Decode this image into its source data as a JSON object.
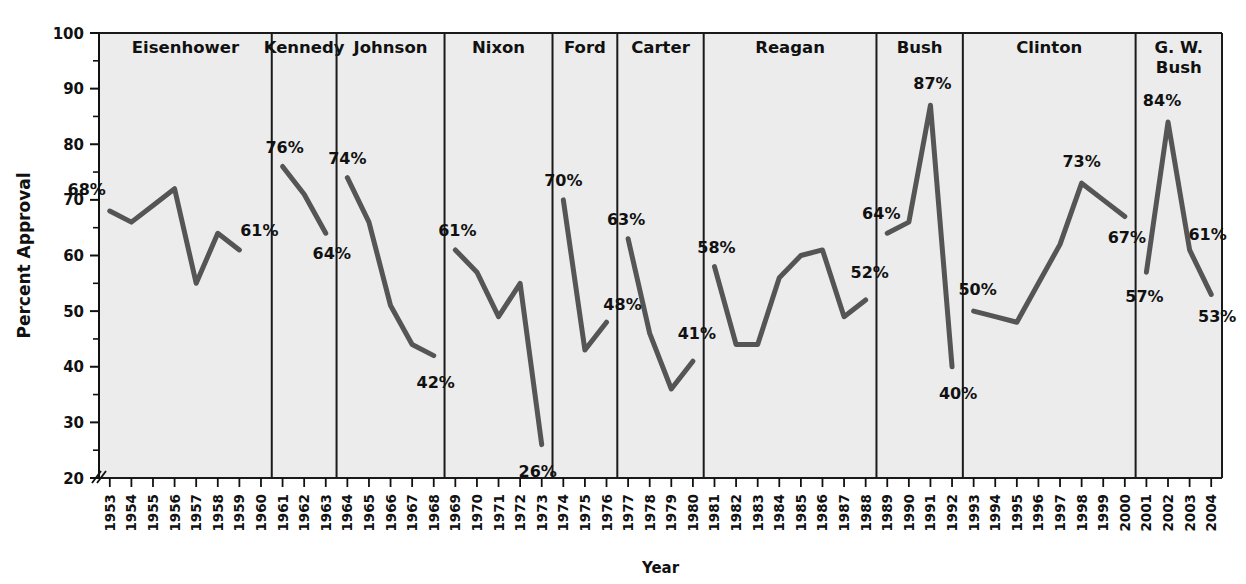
{
  "chart_data": {
    "type": "line",
    "title": "",
    "xlabel": "Year",
    "ylabel": "Percent Approval",
    "ylim": [
      20,
      100
    ],
    "y_ticks_major": [
      20,
      30,
      40,
      50,
      60,
      70,
      80,
      90,
      100
    ],
    "y_ticks_minor": [
      25,
      35,
      45,
      55,
      65,
      75,
      85,
      95
    ],
    "y_axis_break": true,
    "grid": false,
    "legend": "none",
    "line_color": "#555555",
    "panel_background": "#ececec",
    "panel_border_color": "#1a1a1a",
    "x": [
      1953,
      1954,
      1955,
      1956,
      1957,
      1958,
      1959,
      1960,
      1961,
      1962,
      1963,
      1964,
      1965,
      1966,
      1967,
      1968,
      1969,
      1970,
      1971,
      1972,
      1973,
      1974,
      1975,
      1976,
      1977,
      1978,
      1979,
      1980,
      1981,
      1982,
      1983,
      1984,
      1985,
      1986,
      1987,
      1988,
      1989,
      1990,
      1991,
      1992,
      1993,
      1994,
      1995,
      1996,
      1997,
      1998,
      1999,
      2000,
      2001,
      2002,
      2003,
      2004
    ],
    "panels": [
      {
        "name": "Eisenhower",
        "years": [
          1953,
          1954,
          1955,
          1956,
          1957,
          1958,
          1959,
          1960
        ],
        "values": [
          68,
          66,
          69,
          72,
          55,
          64,
          61,
          null
        ],
        "annotations": [
          {
            "label": "68%",
            "year": 1953,
            "value": 68
          },
          {
            "label": "61%",
            "year": 1959,
            "value": 61
          }
        ]
      },
      {
        "name": "Kennedy",
        "years": [
          1961,
          1962,
          1963
        ],
        "values": [
          76,
          71,
          64
        ],
        "annotations": [
          {
            "label": "76%",
            "year": 1961,
            "value": 76
          },
          {
            "label": "64%",
            "year": 1963,
            "value": 64
          }
        ]
      },
      {
        "name": "Johnson",
        "years": [
          1964,
          1965,
          1966,
          1967,
          1968
        ],
        "values": [
          74,
          66,
          51,
          44,
          42
        ],
        "annotations": [
          {
            "label": "74%",
            "year": 1964,
            "value": 74
          },
          {
            "label": "42%",
            "year": 1968,
            "value": 42
          }
        ]
      },
      {
        "name": "Nixon",
        "years": [
          1969,
          1970,
          1971,
          1972,
          1973
        ],
        "values": [
          61,
          57,
          49,
          55,
          26
        ],
        "annotations": [
          {
            "label": "61%",
            "year": 1969,
            "value": 61
          },
          {
            "label": "26%",
            "year": 1973,
            "value": 26
          }
        ]
      },
      {
        "name": "Ford",
        "years": [
          1974,
          1975,
          1976
        ],
        "values": [
          70,
          43,
          48
        ],
        "annotations": [
          {
            "label": "70%",
            "year": 1974,
            "value": 70
          },
          {
            "label": "48%",
            "year": 1976,
            "value": 48
          }
        ]
      },
      {
        "name": "Carter",
        "years": [
          1977,
          1978,
          1979,
          1980
        ],
        "values": [
          63,
          46,
          36,
          41
        ],
        "annotations": [
          {
            "label": "63%",
            "year": 1977,
            "value": 63
          },
          {
            "label": "41%",
            "year": 1980,
            "value": 41
          }
        ]
      },
      {
        "name": "Reagan",
        "years": [
          1981,
          1982,
          1983,
          1984,
          1985,
          1986,
          1987,
          1988
        ],
        "values": [
          58,
          44,
          44,
          56,
          60,
          61,
          49,
          52
        ],
        "annotations": [
          {
            "label": "58%",
            "year": 1981,
            "value": 58
          },
          {
            "label": "52%",
            "year": 1988,
            "value": 52
          }
        ]
      },
      {
        "name": "Bush",
        "years": [
          1989,
          1990,
          1991,
          1992
        ],
        "values": [
          64,
          66,
          87,
          40
        ],
        "annotations": [
          {
            "label": "64%",
            "year": 1989,
            "value": 64
          },
          {
            "label": "87%",
            "year": 1991,
            "value": 87
          },
          {
            "label": "40%",
            "year": 1992,
            "value": 40
          }
        ]
      },
      {
        "name": "Clinton",
        "years": [
          1993,
          1994,
          1995,
          1996,
          1997,
          1998,
          1999,
          2000
        ],
        "values": [
          50,
          49,
          48,
          55,
          62,
          73,
          70,
          67
        ],
        "annotations": [
          {
            "label": "50%",
            "year": 1993,
            "value": 50
          },
          {
            "label": "73%",
            "year": 1998,
            "value": 73
          },
          {
            "label": "67%",
            "year": 2000,
            "value": 67
          }
        ]
      },
      {
        "name": "G. W.\nBush",
        "name_lines": [
          "G. W.",
          "Bush"
        ],
        "years": [
          2001,
          2002,
          2003,
          2004
        ],
        "values": [
          57,
          84,
          61,
          53
        ],
        "annotations": [
          {
            "label": "57%",
            "year": 2001,
            "value": 57
          },
          {
            "label": "84%",
            "year": 2002,
            "value": 84
          },
          {
            "label": "61%",
            "year": 2003,
            "value": 61
          },
          {
            "label": "53%",
            "year": 2004,
            "value": 53
          }
        ]
      }
    ]
  },
  "axes": {
    "y_label": "Percent Approval",
    "x_label": "Year",
    "y_tick_labels": [
      "20",
      "30",
      "40",
      "50",
      "60",
      "70",
      "80",
      "90",
      "100"
    ],
    "x_tick_labels": [
      "1953",
      "1954",
      "1955",
      "1956",
      "1957",
      "1958",
      "1959",
      "1960",
      "1961",
      "1962",
      "1963",
      "1964",
      "1965",
      "1966",
      "1967",
      "1968",
      "1969",
      "1970",
      "1971",
      "1972",
      "1973",
      "1974",
      "1975",
      "1976",
      "1977",
      "1978",
      "1979",
      "1980",
      "1981",
      "1982",
      "1983",
      "1984",
      "1985",
      "1986",
      "1987",
      "1988",
      "1989",
      "1990",
      "1991",
      "1992",
      "1993",
      "1994",
      "1995",
      "1996",
      "1997",
      "1998",
      "1999",
      "2000",
      "2001",
      "2002",
      "2003",
      "2004"
    ]
  }
}
